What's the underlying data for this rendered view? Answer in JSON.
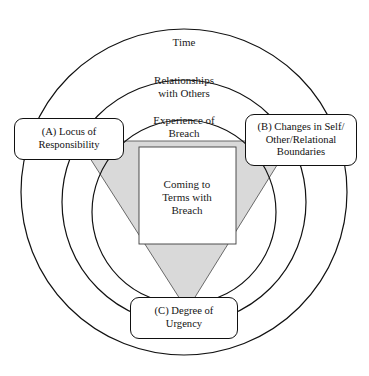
{
  "figure": {
    "background_color": "#ffffff",
    "line_color": "#111111",
    "shade_color": "#d9d9d9"
  },
  "rings": [
    {
      "id": "outer",
      "label": "Time",
      "cx": 184,
      "cy": 192,
      "r": 163
    },
    {
      "id": "middle",
      "label": "Relationships\nwith Others",
      "cx": 184,
      "cy": 202,
      "r": 122
    },
    {
      "id": "inner",
      "label": "Experience of\nBreach",
      "cx": 184,
      "cy": 212,
      "r": 92
    }
  ],
  "core": {
    "label": "Coming to\nTerms with\nBreach",
    "rect": {
      "x": 139,
      "y": 147,
      "width": 97,
      "height": 97
    },
    "fill": "#ffffff"
  },
  "triangle": {
    "fill": "#d9d9d9",
    "points": "79,141 292,141 187,310"
  },
  "callouts": [
    {
      "id": "a",
      "label": "(A) Locus of\nResponsibility"
    },
    {
      "id": "b",
      "label": "(B) Changes in Self/\nOther/Relational\nBoundaries"
    },
    {
      "id": "c",
      "label": "(C) Degree of\nUrgency"
    }
  ]
}
